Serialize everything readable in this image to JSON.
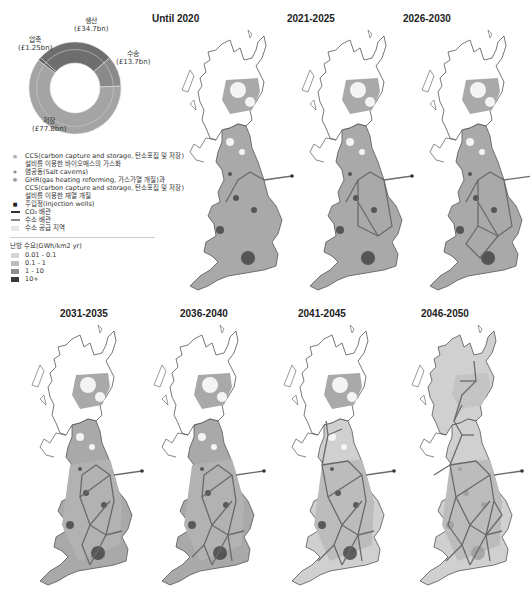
{
  "donut": {
    "segments": [
      {
        "label": "생산",
        "value_label": "(£34.7bn)",
        "value": 34.7,
        "color": "#6e6e6e"
      },
      {
        "label": "수송",
        "value_label": "(£13.7bn)",
        "value": 13.7,
        "color": "#8a8a8a"
      },
      {
        "label": "저장",
        "value_label": "(£77.8bn)",
        "value": 77.8,
        "color": "#a4a4a4"
      },
      {
        "label": "압축",
        "value_label": "(£1.25bn)",
        "value": 1.25,
        "color": "#5a5a5a"
      }
    ]
  },
  "legend": {
    "items": [
      {
        "symbol": "dot-light",
        "text": "CCS(carbon capture and storage, 탄소포집 및 저장)"
      },
      {
        "symbol": "",
        "text": "설비를 이용한 바이오매스의 가스화"
      },
      {
        "symbol": "star",
        "text": "염공동(Salt caverns)"
      },
      {
        "symbol": "dot-mid",
        "text": "GHR(gas heating reforming, 가스가열 개질)과"
      },
      {
        "symbol": "",
        "text": "CCS(carbon capture and storage, 탄소포집 및 저장)"
      },
      {
        "symbol": "",
        "text": "설비를 이용한 재열 개질"
      },
      {
        "symbol": "dot-dark",
        "text": "주입정(Injection wells)"
      },
      {
        "symbol": "line-dark",
        "text": "CO₂ 배관"
      },
      {
        "symbol": "line-mid",
        "text": "수소 배관"
      },
      {
        "symbol": "swatch-pale",
        "text": "수소 공급 지역"
      }
    ],
    "demand_title": "난방 수요(GWh/km2 yr)",
    "demand_classes": [
      {
        "label": "0.01 - 0.1",
        "color": "#d6d6d6"
      },
      {
        "label": "0.1 - 1",
        "color": "#bdbdbd"
      },
      {
        "label": "1 - 10",
        "color": "#8e8e8e"
      },
      {
        "label": "10+",
        "color": "#3a3a3a"
      }
    ]
  },
  "maps": [
    {
      "title": "Until 2020",
      "stage": 0
    },
    {
      "title": "2021-2025",
      "stage": 1
    },
    {
      "title": "2026-2030",
      "stage": 2
    },
    {
      "title": "2031-2035",
      "stage": 3
    },
    {
      "title": "2036-2040",
      "stage": 4
    },
    {
      "title": "2041-2045",
      "stage": 5
    },
    {
      "title": "2046-2050",
      "stage": 6
    }
  ],
  "colors": {
    "land_fill": "#a9a9a9",
    "pale_fill": "#d0d0d0",
    "outline": "#555555",
    "pipeline": "#6a6a6a",
    "hotspot": "#3a3a3a"
  }
}
